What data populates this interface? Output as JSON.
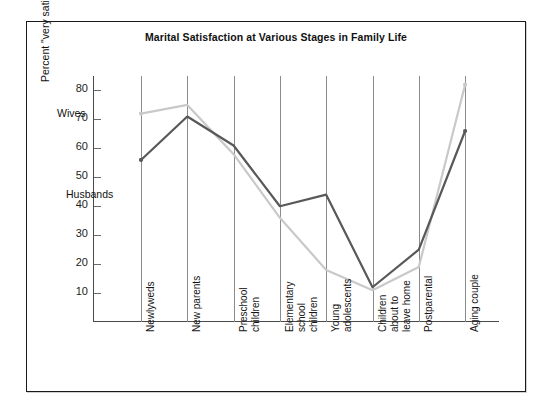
{
  "figure": {
    "title": "Marital Satisfaction at Various Stages in Family Life",
    "ylabel": "Percent \"very satisfied\" with marriage",
    "series_labels": {
      "wives": "Wives",
      "husbands": "Husbands"
    },
    "colors": {
      "husbands": "#585858",
      "wives": "#c9c9c9",
      "frame": "#1a1a1a",
      "grid": "#8b8b8b"
    }
  },
  "chart_data": {
    "type": "line",
    "title": "Marital Satisfaction at Various Stages in Family Life",
    "xlabel": "",
    "ylabel": "Percent \"very satisfied\" with marriage",
    "categories": [
      "Newlyweds",
      "New parents",
      "Preschool children",
      "Elementary school children",
      "Young adolescents",
      "Children about to leave home",
      "Postparental",
      "Aging couple"
    ],
    "category_lines": [
      [
        "Newlyweds"
      ],
      [
        "New parents"
      ],
      [
        "Preschool",
        "children"
      ],
      [
        "Elementary",
        "school",
        "children"
      ],
      [
        "Young",
        "adolescents"
      ],
      [
        "Children",
        "about to",
        "leave home"
      ],
      [
        "Postparental"
      ],
      [
        "Aging couple"
      ]
    ],
    "series": [
      {
        "name": "Wives",
        "color": "#c9c9c9",
        "values": [
          72,
          75,
          58,
          36,
          18,
          11,
          19,
          82
        ]
      },
      {
        "name": "Husbands",
        "color": "#585858",
        "values": [
          56,
          71,
          61,
          40,
          44,
          12,
          25,
          66
        ]
      }
    ],
    "ylim": [
      0,
      85
    ],
    "yticks": [
      10,
      20,
      30,
      40,
      50,
      60,
      70,
      80
    ],
    "grid": true,
    "legend": "inline-annotations"
  }
}
